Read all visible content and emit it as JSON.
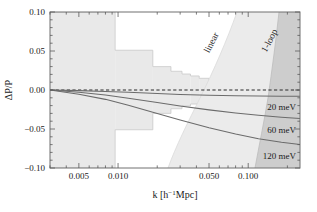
{
  "chart_data": {
    "type": "line",
    "title": "",
    "xlabel": "k [h⁻¹Mpc]",
    "ylabel": "ΔP/P",
    "xscale": "log",
    "xlim": [
      0.003,
      0.25
    ],
    "ylim": [
      -0.1,
      0.1
    ],
    "grid": false,
    "legend_position": "inline-right",
    "xticks": [
      {
        "value": 0.005,
        "label": "0.005"
      },
      {
        "value": 0.01,
        "label": "0.010"
      },
      {
        "value": 0.05,
        "label": "0.050"
      },
      {
        "value": 0.1,
        "label": "0.100"
      }
    ],
    "yticks": [
      {
        "value": 0.1,
        "label": "0.10"
      },
      {
        "value": 0.05,
        "label": "0.05"
      },
      {
        "value": 0.0,
        "label": "0.00"
      },
      {
        "value": -0.05,
        "label": "−0.05"
      },
      {
        "value": -0.1,
        "label": "−0.10"
      }
    ],
    "zero_line": {
      "value": 0.0,
      "style": "dashed",
      "color": "#2a2a2a"
    },
    "series": [
      {
        "name": "20 meV",
        "label": "20 meV",
        "color": "#6b6b6b",
        "x": [
          0.003,
          0.005,
          0.008,
          0.012,
          0.02,
          0.03,
          0.05,
          0.08,
          0.12,
          0.18,
          0.25
        ],
        "values": [
          0.0,
          -0.0008,
          -0.0018,
          -0.003,
          -0.0046,
          -0.0058,
          -0.0068,
          -0.0074,
          -0.0078,
          -0.008,
          -0.008
        ]
      },
      {
        "name": "60 meV",
        "label": "60 meV",
        "color": "#6b6b6b",
        "x": [
          0.003,
          0.005,
          0.008,
          0.012,
          0.02,
          0.03,
          0.05,
          0.08,
          0.12,
          0.18,
          0.25
        ],
        "values": [
          0.0,
          -0.003,
          -0.0065,
          -0.0105,
          -0.016,
          -0.0205,
          -0.0255,
          -0.0295,
          -0.0325,
          -0.035,
          -0.0365
        ]
      },
      {
        "name": "120 meV",
        "label": "120 meV",
        "color": "#6b6b6b",
        "x": [
          0.003,
          0.005,
          0.008,
          0.012,
          0.02,
          0.03,
          0.05,
          0.08,
          0.12,
          0.18,
          0.25
        ],
        "values": [
          0.0,
          -0.0055,
          -0.012,
          -0.0195,
          -0.03,
          -0.0385,
          -0.0485,
          -0.0565,
          -0.0625,
          -0.067,
          -0.07
        ]
      }
    ],
    "regions": [
      {
        "name": "linear",
        "label": "linear",
        "color": "#eaeaea",
        "description": "Light shaded wedge bounded by the linear theory cutoff, opening toward larger k"
      },
      {
        "name": "1-loop",
        "label": "1-loop",
        "color": "#cdcdcd",
        "description": "Darker shaded wedge bounded by the 1-loop theory cutoff at the largest k"
      },
      {
        "name": "cosmic-variance-band",
        "label": "",
        "color": "#e9e9e9",
        "description": "Symmetric staircase error band about zero narrowing with increasing k",
        "steps": [
          {
            "k_lo": 0.003,
            "k_hi": 0.0095,
            "half_width": 0.1
          },
          {
            "k_lo": 0.0095,
            "k_hi": 0.0185,
            "half_width": 0.051
          },
          {
            "k_lo": 0.0185,
            "k_hi": 0.0255,
            "half_width": 0.03
          },
          {
            "k_lo": 0.0255,
            "k_hi": 0.031,
            "half_width": 0.024
          },
          {
            "k_lo": 0.031,
            "k_hi": 0.036,
            "half_width": 0.0205
          },
          {
            "k_lo": 0.036,
            "k_hi": 0.042,
            "half_width": 0.018
          },
          {
            "k_lo": 0.042,
            "k_hi": 0.05,
            "half_width": 0.015
          },
          {
            "k_lo": 0.05,
            "k_hi": 0.062,
            "half_width": 0.012
          },
          {
            "k_lo": 0.062,
            "k_hi": 0.08,
            "half_width": 0.0095
          },
          {
            "k_lo": 0.08,
            "k_hi": 0.11,
            "half_width": 0.0072
          },
          {
            "k_lo": 0.11,
            "k_hi": 0.16,
            "half_width": 0.0052
          },
          {
            "k_lo": 0.16,
            "k_hi": 0.25,
            "half_width": 0.0036
          }
        ]
      }
    ]
  },
  "axes": {
    "y_title": "ΔP/P",
    "x_title": "k [h⁻¹Mpc]",
    "x_title_parts": {
      "symbol": "k",
      "bracket_open": "[h",
      "exponent": "−1",
      "unit": "Mpc]"
    }
  },
  "labels": {
    "linear": "linear",
    "one_loop": "1-loop",
    "m20": "20 meV",
    "m60": "60 meV",
    "m120": "120 meV"
  },
  "ticks": {
    "x": [
      "0.005",
      "0.010",
      "0.050",
      "0.100"
    ],
    "y": [
      "0.10",
      "0.05",
      "0.00",
      "−0.05",
      "−0.10"
    ]
  },
  "colors": {
    "frame": "#707070",
    "band_light": "#e9e9e9",
    "region_linear": "#ebebeb",
    "region_one_loop": "#cdcdcd",
    "curve": "#6b6b6b",
    "zero_line": "#2a2a2a",
    "text": "#1a1a1a",
    "background": "#ffffff"
  }
}
